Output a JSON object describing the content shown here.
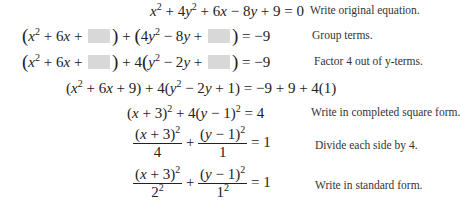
{
  "steps": [
    {
      "equation": "x² + 4y² + 6x − 8y + 9 = 0",
      "label": "Write original equation."
    },
    {
      "equation": "(x² + 6x + ▢) + (4y² − 8y + ▢) = −9",
      "label": "Group terms."
    },
    {
      "equation": "(x² + 6x + ▢) + 4(y² − 2y + ▢) = −9",
      "label": "Factor 4 out of y-terms."
    },
    {
      "equation": "(x² + 6x + 9) + 4(y² − 2y + 1) = −9 + 9 + 4(1)",
      "label": ""
    },
    {
      "equation": "(x + 3)² + 4(y − 1)² = 4",
      "label": "Write in completed square form."
    },
    {
      "equation": "(x + 3)²/4 + (y − 1)²/1 = 1",
      "label": "Divide each side by 4."
    },
    {
      "equation": "(x + 3)²/2² + (y − 1)²/1² = 1",
      "label": "Write in standard form."
    }
  ],
  "pieces": {
    "plus": "+",
    "minus": "−",
    "eq": "=",
    "zero": "0",
    "one": "1",
    "four": "4",
    "nine": "9",
    "negnine": "−9",
    "x": "x",
    "y": "y",
    "two": "2",
    "three": "3",
    "row4_rhs": "−9 + 9 + 4(1)"
  }
}
